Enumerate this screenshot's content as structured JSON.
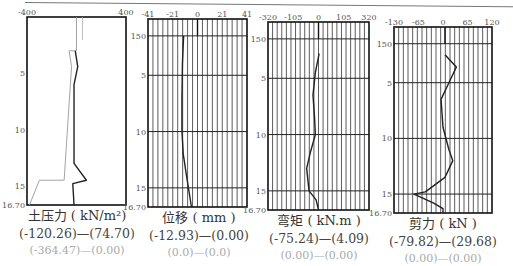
{
  "chart_data": [
    {
      "type": "line",
      "title": "土压力 ( kN/m²)",
      "xlabel": "土压力 (kN/m²)",
      "ylabel": "深度 (m)",
      "x_ticks": [
        "-400",
        "400"
      ],
      "xlim": [
        -400,
        400
      ],
      "y_ticks": [
        "5",
        "10",
        "15",
        "16.70"
      ],
      "ylim": [
        0,
        16.7
      ],
      "grid": false,
      "range_primary": "(-120.26)—(74.70)",
      "range_secondary": "(-364.47)—(0.00)",
      "series": [
        {
          "name": "earth-pressure-light",
          "color": "#999999",
          "points": [
            [
              0,
              0
            ],
            [
              0,
              3.0
            ],
            [
              -60,
              3.0
            ],
            [
              -40,
              4.4
            ],
            [
              -100,
              14.5
            ],
            [
              -300,
              14.5
            ],
            [
              -380,
              16.7
            ]
          ]
        },
        {
          "name": "earth-pressure-dark",
          "color": "#222222",
          "points": [
            [
              -10,
              3.0
            ],
            [
              10,
              4.4
            ],
            [
              -20,
              6.0
            ],
            [
              -20,
              13.0
            ],
            [
              80,
              14.5
            ],
            [
              -30,
              14.8
            ],
            [
              -20,
              16.7
            ]
          ]
        }
      ]
    },
    {
      "type": "line",
      "title": "位移 ( mm )",
      "xlabel": "位移 (mm)",
      "x_ticks": [
        "-41",
        "-21",
        "0",
        "21",
        "41"
      ],
      "xlim": [
        -41,
        41
      ],
      "y_ticks": [
        "150",
        "5",
        "10",
        "15",
        "16.70"
      ],
      "ylim": [
        0,
        16.7
      ],
      "grid": true,
      "range_primary": "(-12.93)—(0.00)",
      "range_secondary": "(0.0)—(0.0)",
      "series": [
        {
          "name": "displacement",
          "color": "#222222",
          "points": [
            [
              -11.5,
              1.5
            ],
            [
              -12.5,
              4
            ],
            [
              -12.9,
              7
            ],
            [
              -12.9,
              10
            ],
            [
              -11.8,
              12
            ],
            [
              -9,
              14
            ],
            [
              -5,
              16.7
            ]
          ]
        }
      ]
    },
    {
      "type": "line",
      "title": "弯矩 ( kN.m )",
      "xlabel": "弯矩 (kN.m)",
      "x_ticks": [
        "-320",
        "-105",
        "0",
        "105",
        "320"
      ],
      "xlim": [
        -320,
        320
      ],
      "y_ticks": [
        "150",
        "5",
        "10",
        "15",
        "16.70"
      ],
      "ylim": [
        0,
        16.7
      ],
      "grid": true,
      "range_primary": "(-75.24)—(4.09)",
      "range_secondary": "(0.00)—(0.00)",
      "series": [
        {
          "name": "bending-moment",
          "color": "#222222",
          "points": [
            [
              4,
              2.8
            ],
            [
              -20,
              4.5
            ],
            [
              -35,
              6.5
            ],
            [
              -25,
              8.5
            ],
            [
              -20,
              10
            ],
            [
              -50,
              11.5
            ],
            [
              -75,
              13
            ],
            [
              -60,
              15
            ],
            [
              -15,
              15.8
            ],
            [
              0,
              16.7
            ]
          ]
        }
      ]
    },
    {
      "type": "line",
      "title": "剪力 ( kN )",
      "xlabel": "剪力 (kN)",
      "x_ticks": [
        "-130",
        "-65",
        "0",
        "65",
        "120"
      ],
      "xlim": [
        -130,
        120
      ],
      "y_ticks": [
        "150",
        "5",
        "10",
        "15",
        "16.70"
      ],
      "ylim": [
        0,
        16.7
      ],
      "grid": true,
      "range_primary": "(-79.82)—(29.68)",
      "range_secondary": "(0.00)—(0.00)",
      "series": [
        {
          "name": "shear-force",
          "color": "#222222",
          "points": [
            [
              0,
              2.5
            ],
            [
              29,
              3.6
            ],
            [
              10,
              5
            ],
            [
              -10,
              6.5
            ],
            [
              -5,
              9
            ],
            [
              10,
              11
            ],
            [
              20,
              12
            ],
            [
              0,
              13.5
            ],
            [
              -50,
              14.8
            ],
            [
              -79,
              15.0
            ],
            [
              -30,
              15.8
            ],
            [
              -5,
              16.3
            ],
            [
              -5,
              16.7
            ]
          ]
        }
      ]
    }
  ],
  "captions": [
    {
      "title": "土压力 ( kN/m²)",
      "range1": "(-120.26)—(74.70)",
      "range2": "(-364.47)—(0.00)"
    },
    {
      "title": "位移 ( mm )",
      "range1": "(-12.93)—(0.00)",
      "range2": "(0.0)—(0.0)"
    },
    {
      "title": "弯矩 ( kN.m )",
      "range1": "(-75.24)—(4.09)",
      "range2": "(0.00)—(0.00)"
    },
    {
      "title": "剪力 ( kN )",
      "range1": "(-79.82)—(29.68)",
      "range2": "(0.00)—(0.00)"
    }
  ]
}
